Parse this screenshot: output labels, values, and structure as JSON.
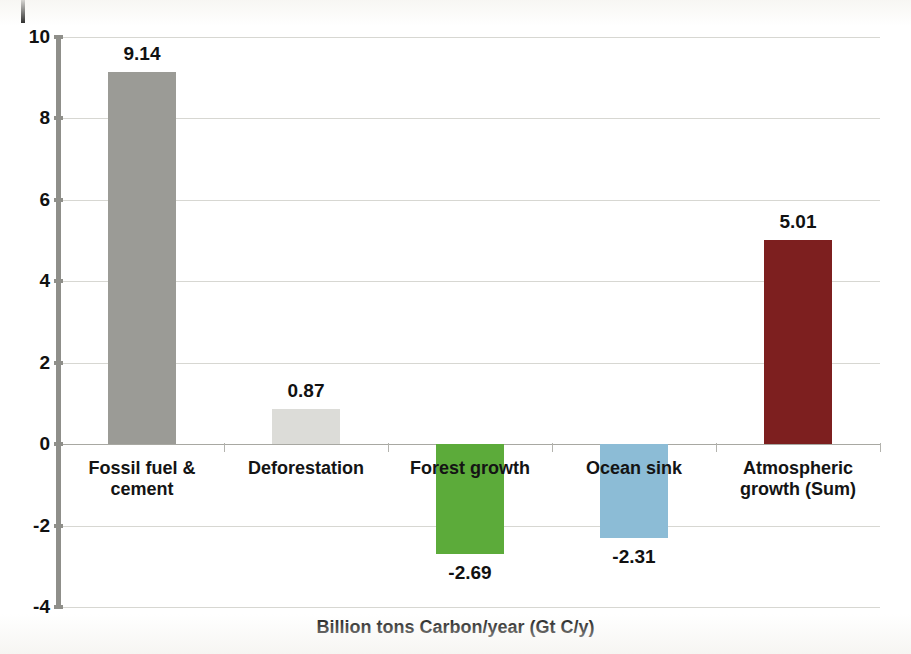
{
  "page": {
    "clipped_caption_text": "",
    "background_color": "#ffffff"
  },
  "chart_data": {
    "type": "bar",
    "title": "",
    "subtitle": "",
    "xlabel": "Billion tons Carbon/year (Gt C/y)",
    "ylabel": "",
    "ylim": [
      -4,
      10
    ],
    "ytick_labels": [
      "10",
      "8",
      "6",
      "4",
      "2",
      "0",
      "-2",
      "-4"
    ],
    "yticks": [
      10,
      8,
      6,
      4,
      2,
      0,
      -2,
      -4
    ],
    "grid": true,
    "legend": "none",
    "categories": [
      "Fossil fuel &\ncement",
      "Deforestation",
      "Forest growth",
      "Ocean sink",
      "Atmospheric\ngrowth (Sum)"
    ],
    "values": [
      9.14,
      0.87,
      -2.69,
      -2.31,
      5.01
    ],
    "value_labels": [
      "9.14",
      "0.87",
      "-2.69",
      "-2.31",
      "5.01"
    ],
    "colors": [
      "#9b9b96",
      "#dcdcd8",
      "#5cab3a",
      "#8cbcd6",
      "#7d1f1f"
    ],
    "bar_names": [
      "bar-fossil-fuel-and-cement",
      "bar-deforestation",
      "bar-forest-growth",
      "bar-ocean-sink",
      "bar-atmospheric-growth-sum"
    ]
  },
  "axis": {
    "spine_color": "#8f8f8a",
    "gridline_color": "#d7d7d2",
    "zero_line_color": "#a8a8a2"
  }
}
